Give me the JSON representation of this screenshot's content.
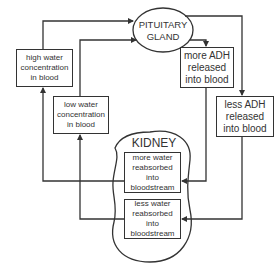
{
  "diagram": {
    "pituitary": {
      "line1": "PITUITARY",
      "line2": "GLAND"
    },
    "kidney": {
      "label": "KIDNEY"
    },
    "boxes": {
      "high_water": {
        "line1": "high water",
        "line2": "concentration",
        "line3": "in blood"
      },
      "low_water": {
        "line1": "low water",
        "line2": "concentration",
        "line3": "in blood"
      },
      "more_adh": {
        "line1": "more ADH",
        "line2": "released",
        "line3": "into blood"
      },
      "less_adh": {
        "line1": "less ADH",
        "line2": "released",
        "line3": "into blood"
      },
      "more_reabsorbed": {
        "line1": "more water",
        "line2": "reabsorbed",
        "line3": "into",
        "line4": "bloodstream"
      },
      "less_reabsorbed": {
        "line1": "less water",
        "line2": "reabsorbed",
        "line3": "into",
        "line4": "bloodstream"
      }
    },
    "colors": {
      "stroke": "#333333",
      "background": "#ffffff"
    }
  }
}
